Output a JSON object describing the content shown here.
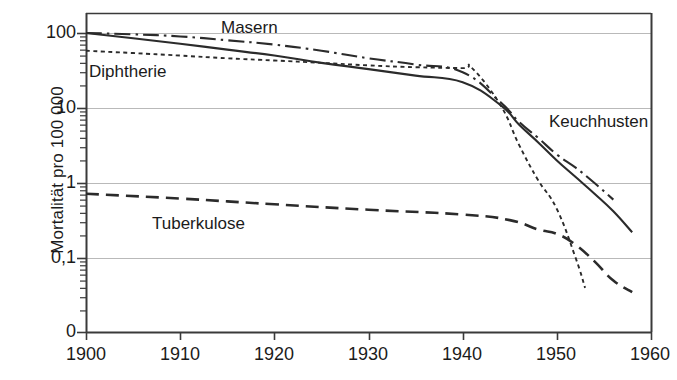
{
  "chart_data": {
    "type": "line",
    "title": "",
    "xlabel": "",
    "ylabel": "Mortalität pro 100 000",
    "xlim": [
      1900,
      1960
    ],
    "ylim_log": [
      0.02,
      200
    ],
    "yscale": "log",
    "grid": true,
    "legend": "inline-annotations",
    "x_ticks": [
      "1900",
      "1910",
      "1920",
      "1930",
      "1940",
      "1950",
      "1960"
    ],
    "y_ticks": [
      "100",
      "10",
      "1",
      "0,1",
      "0"
    ],
    "series": [
      {
        "name": "Masern",
        "label": "Masern",
        "style": "dash-dot",
        "color": "#2b2b2b",
        "x": [
          1900,
          1905,
          1910,
          1915,
          1920,
          1925,
          1930,
          1935,
          1940,
          1944,
          1946,
          1948,
          1950,
          1952,
          1954,
          1956
        ],
        "y": [
          100,
          96,
          90,
          80,
          70,
          58,
          46,
          38,
          30,
          12,
          6.5,
          4,
          2.4,
          1.6,
          1.0,
          0.6
        ]
      },
      {
        "name": "Keuchhusten",
        "label": "Keuchhusten",
        "style": "solid",
        "color": "#2b2b2b",
        "x": [
          1900,
          1905,
          1910,
          1915,
          1920,
          1925,
          1930,
          1935,
          1940,
          1944,
          1946,
          1948,
          1950,
          1952,
          1954,
          1956,
          1958
        ],
        "y": [
          100,
          85,
          72,
          60,
          50,
          40,
          33,
          27,
          22,
          11,
          6.0,
          3.5,
          2.0,
          1.2,
          0.72,
          0.42,
          0.22
        ]
      },
      {
        "name": "Diphtherie",
        "label": "Diphtherie",
        "style": "dotted",
        "color": "#2b2b2b",
        "x": [
          1900,
          1905,
          1910,
          1915,
          1920,
          1925,
          1930,
          1935,
          1940,
          1941,
          1944,
          1946,
          1948,
          1950,
          1952,
          1953
        ],
        "y": [
          58,
          54,
          50,
          46,
          43,
          40,
          37,
          35,
          34,
          34,
          11,
          3.2,
          1.1,
          0.45,
          0.1,
          0.04
        ]
      },
      {
        "name": "Tuberkulose",
        "label": "Tuberkulose",
        "style": "dashed",
        "color": "#2b2b2b",
        "x": [
          1900,
          1910,
          1920,
          1930,
          1940,
          1945,
          1948,
          1950,
          1952,
          1954,
          1956,
          1958
        ],
        "y": [
          0.72,
          0.62,
          0.52,
          0.44,
          0.38,
          0.32,
          0.24,
          0.21,
          0.15,
          0.09,
          0.05,
          0.035
        ]
      }
    ],
    "annotations": [
      {
        "text": "Masern",
        "x": 1924,
        "y_px": 28
      },
      {
        "text": "Diphtherie",
        "x": 1901,
        "y_px": 72
      },
      {
        "text": "Keuchhusten",
        "x": 1950,
        "y_px": 122
      },
      {
        "text": "Tuberkulose",
        "x": 1909,
        "y_px": 224
      }
    ]
  },
  "axes": {
    "y_title": "Mortalität pro 100 000",
    "y_ticks": [
      {
        "label": "100",
        "top": 22
      },
      {
        "label": "10",
        "top": 97
      },
      {
        "label": "1",
        "top": 172
      },
      {
        "label": "0,1",
        "top": 247
      },
      {
        "label": "0",
        "top": 321
      }
    ],
    "x_ticks": [
      {
        "label": "1900",
        "left": 51
      },
      {
        "label": "1910",
        "left": 145
      },
      {
        "label": "1920",
        "left": 239
      },
      {
        "label": "1930",
        "left": 333
      },
      {
        "label": "1940",
        "left": 427
      },
      {
        "label": "1950",
        "left": 521
      },
      {
        "label": "1960",
        "left": 615
      }
    ]
  },
  "series_labels": [
    {
      "name": "Masern",
      "left": 221,
      "top": 18
    },
    {
      "name": "Diphtherie",
      "left": 89,
      "top": 62
    },
    {
      "name": "Keuchhusten",
      "left": 549,
      "top": 112
    },
    {
      "name": "Tuberkulose",
      "left": 152,
      "top": 214
    }
  ],
  "colors": {
    "ink": "#2b2b2b",
    "grid": "#b9b9b9",
    "axis": "#3a3a3a",
    "background": "#ffffff"
  }
}
